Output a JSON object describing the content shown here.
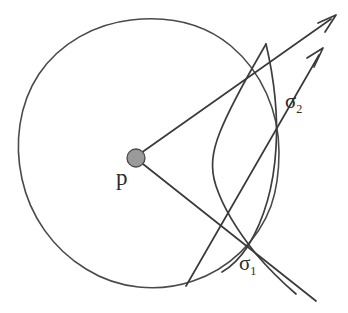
{
  "figure": {
    "type": "geometric-diagram",
    "background_color": "#ffffff",
    "ink_color": "#3a3a3a",
    "point_marker_color": "#9a9a9a",
    "labels": {
      "center_point": "p",
      "upper_intersection_base": "σ",
      "upper_intersection_sub": "2",
      "lower_intersection_base": "σ",
      "lower_intersection_sub": "1"
    },
    "circle": {
      "center_x": 147,
      "center_y": 155,
      "radius": 132
    },
    "point_p": {
      "x": 136,
      "y": 158,
      "radius": 9
    },
    "rays": [
      {
        "name": "upper-ray",
        "from_x": 140,
        "from_y": 154,
        "to_x": 336,
        "to_y": 16,
        "arrowhead": true
      },
      {
        "name": "lower-ray",
        "from_x": 142,
        "from_y": 164,
        "to_x": 314,
        "to_y": 300,
        "arrowhead": false
      },
      {
        "name": "secondary-upper-ray",
        "from_x": 200,
        "from_y": 268,
        "to_x": 324,
        "to_y": 50,
        "arrowhead": true
      }
    ],
    "curve": {
      "name": "sigma-curve",
      "leftmost_x": 212,
      "leftmost_y": 168
    }
  }
}
